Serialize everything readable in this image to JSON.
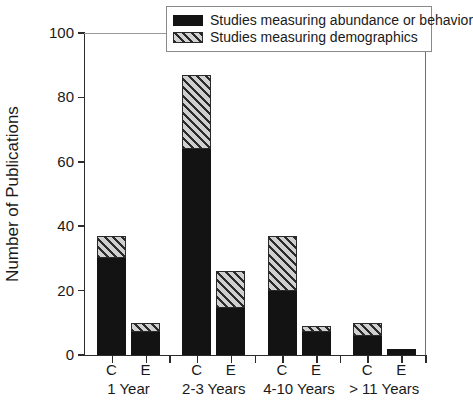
{
  "chart_data": {
    "type": "bar",
    "subtype": "stacked-grouped",
    "title": "",
    "xlabel": "",
    "ylabel": "Number of Publications",
    "ylim": [
      0,
      100
    ],
    "yticks": [
      0,
      20,
      40,
      60,
      80,
      100
    ],
    "ytick_labels": [
      "0",
      "20",
      "40",
      "60",
      "80",
      "100"
    ],
    "grid": false,
    "legend_position": "top-right-inside",
    "groups": [
      {
        "label": "1 Year",
        "bars": [
          {
            "label": "C",
            "abundance_or_behavior": 30,
            "demographics": 7,
            "total": 37
          },
          {
            "label": "E",
            "abundance_or_behavior": 7,
            "demographics": 3,
            "total": 10
          }
        ]
      },
      {
        "label": "2-3 Years",
        "bars": [
          {
            "label": "C",
            "abundance_or_behavior": 64,
            "demographics": 23,
            "total": 87
          },
          {
            "label": "E",
            "abundance_or_behavior": 14.5,
            "demographics": 11.5,
            "total": 26
          }
        ]
      },
      {
        "label": "4-10 Years",
        "bars": [
          {
            "label": "C",
            "abundance_or_behavior": 20,
            "demographics": 17,
            "total": 37
          },
          {
            "label": "E",
            "abundance_or_behavior": 7,
            "demographics": 2,
            "total": 9
          }
        ]
      },
      {
        "label": "> 11 Years",
        "bars": [
          {
            "label": "C",
            "abundance_or_behavior": 6,
            "demographics": 4,
            "total": 10
          },
          {
            "label": "E",
            "abundance_or_behavior": 2,
            "demographics": 0,
            "total": 2
          }
        ]
      }
    ],
    "series": [
      {
        "name": "Studies measuring abundance or behavior",
        "key": "abundance_or_behavior",
        "color": "#131313",
        "pattern": "solid",
        "values": [
          30,
          7,
          64,
          14.5,
          20,
          7,
          6,
          2
        ]
      },
      {
        "name": "Studies measuring demographics",
        "key": "demographics",
        "color": "#c0c0c0",
        "pattern": "diagonal-hatch",
        "values": [
          7,
          3,
          23,
          11.5,
          17,
          2,
          4,
          0
        ]
      }
    ],
    "categories": [
      "1 Year C",
      "1 Year E",
      "2-3 Years C",
      "2-3 Years E",
      "4-10 Years C",
      "4-10 Years E",
      "> 11 Years C",
      "> 11 Years E"
    ]
  },
  "legend": {
    "items": [
      {
        "label": "Studies measuring abundance or behavior",
        "swatch": "solid-black-swatch"
      },
      {
        "label": "Studies measuring demographics",
        "swatch": "diagonal-hatch-swatch"
      }
    ]
  }
}
